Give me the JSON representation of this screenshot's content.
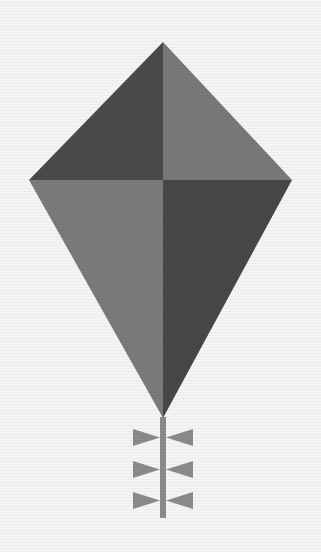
{
  "canvas": {
    "width": 321,
    "height": 552,
    "background_color": "#f5f4f2",
    "title": "Kite"
  },
  "artwork": {
    "subject_name": "kite",
    "description": "Flat geometric illustration of a diamond kite divided into four shaded quadrants with a straight vertical tail carrying three bow ties",
    "style": "flat two-tone grayscale silhouette"
  },
  "palette": {
    "background": "#f5f4f2",
    "dark_gray": "#4a4a4a",
    "dark_gray_alt": "#474747",
    "light_gray": "#787878",
    "light_gray_alt": "#7a7a7a",
    "tail_gray": "#8a8a8a"
  },
  "kite": {
    "name": "kite-body",
    "vertices": {
      "top": {
        "x": 163,
        "y": 42
      },
      "left": {
        "x": 29,
        "y": 180
      },
      "right": {
        "x": 292,
        "y": 180
      },
      "bottom": {
        "x": 163,
        "y": 418
      }
    },
    "spine": {
      "x": 163,
      "from_y": 42,
      "to_y": 418
    },
    "crossbar": {
      "y": 180,
      "from_x": 29,
      "to_x": 292
    },
    "panels": [
      {
        "name": "upper-left-panel",
        "label": "Upper left panel",
        "color": "#4a4a4a",
        "tone": "dark",
        "points": "163,42 163,180 29,180"
      },
      {
        "name": "upper-right-panel",
        "label": "Upper right panel",
        "color": "#787878",
        "tone": "light",
        "points": "163,42 292,180 163,180"
      },
      {
        "name": "lower-left-panel",
        "label": "Lower left panel",
        "color": "#7a7a7a",
        "tone": "light",
        "points": "29,180 163,180 163,418"
      },
      {
        "name": "lower-right-panel",
        "label": "Lower right panel",
        "color": "#474747",
        "tone": "dark",
        "points": "163,180 292,180 163,418"
      }
    ]
  },
  "tail": {
    "name": "kite-tail",
    "color": "#8a8a8a",
    "line": {
      "x": 163,
      "from_y": 417,
      "to_y": 518,
      "width": 6
    },
    "bow_count": 3,
    "bows": [
      {
        "name": "tail-bow-1",
        "label": "Top bow",
        "center_y": 437,
        "left_points": "133,429 133,446 160,437.5",
        "right_points": "193,429 193,446 166,437.5"
      },
      {
        "name": "tail-bow-2",
        "label": "Middle bow",
        "center_y": 469,
        "left_points": "133,461 133,478 160,469.5",
        "right_points": "193,461 193,478 166,469.5"
      },
      {
        "name": "tail-bow-3",
        "label": "Bottom bow",
        "center_y": 500,
        "left_points": "133,492 133,509 160,500.5",
        "right_points": "193,492 193,509 166,500.5"
      }
    ]
  },
  "chart_data": {
    "type": "table",
    "categories": [
      "upper-left",
      "upper-right",
      "lower-left",
      "lower-right"
    ],
    "values": [
      1,
      1,
      1,
      1
    ]
  }
}
